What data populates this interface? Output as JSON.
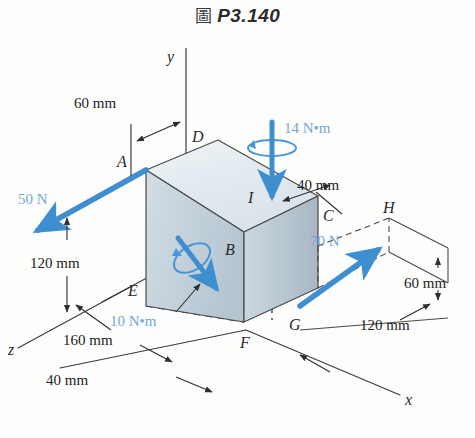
{
  "figure": {
    "title_prefix": "圖",
    "title": "P3.140",
    "background_color": "#fdfdfc"
  },
  "colors": {
    "force_blue": "#3f8fd0",
    "force_label_blue": "#73a7d4",
    "line_dark": "#3a3a3a",
    "box_top": "#e4ecf1",
    "box_front": "#c6d4dd",
    "box_right": "#aebcc7",
    "dash": "#2e2e2e"
  },
  "axes": [
    {
      "name": "y-axis",
      "label": "y"
    },
    {
      "name": "x-axis",
      "label": "x"
    },
    {
      "name": "z-axis",
      "label": "z"
    }
  ],
  "points": [
    {
      "id": "A",
      "label": "A"
    },
    {
      "id": "B",
      "label": "B"
    },
    {
      "id": "C",
      "label": "C"
    },
    {
      "id": "D",
      "label": "D"
    },
    {
      "id": "E",
      "label": "E"
    },
    {
      "id": "F",
      "label": "F"
    },
    {
      "id": "G",
      "label": "G"
    },
    {
      "id": "H",
      "label": "H"
    },
    {
      "id": "I",
      "label": "I"
    }
  ],
  "forces": [
    {
      "id": "force-50n",
      "label": "50 N",
      "type": "force",
      "applied_at": "A",
      "direction": "down-left"
    },
    {
      "id": "force-70n",
      "label": "70 N",
      "type": "force",
      "applied_at": "G",
      "direction": "up-right"
    },
    {
      "id": "couple-14nm",
      "label": "14 N•m",
      "type": "couple",
      "applied_at": "I",
      "direction": "down"
    },
    {
      "id": "couple-10nm",
      "label": "10 N•m",
      "type": "couple",
      "applied_at": "body-diagonal",
      "direction": "down-right"
    }
  ],
  "dimensions": [
    {
      "id": "dim-60mm-top",
      "label": "60 mm",
      "orientation": "horizontal",
      "location": "top-left"
    },
    {
      "id": "dim-120mm-left",
      "label": "120 mm",
      "orientation": "vertical",
      "location": "left"
    },
    {
      "id": "dim-40mm-top-right",
      "label": "40 mm",
      "orientation": "diagonal",
      "location": "top-right"
    },
    {
      "id": "dim-160mm-bottom",
      "label": "160 mm",
      "orientation": "diagonal",
      "location": "bottom-left"
    },
    {
      "id": "dim-40mm-bottom",
      "label": "40 mm",
      "orientation": "diagonal",
      "location": "bottom-center"
    },
    {
      "id": "dim-60mm-right",
      "label": "60 mm",
      "orientation": "vertical",
      "location": "right"
    },
    {
      "id": "dim-120mm-right",
      "label": "120 mm",
      "orientation": "diagonal",
      "location": "bottom-right"
    }
  ]
}
